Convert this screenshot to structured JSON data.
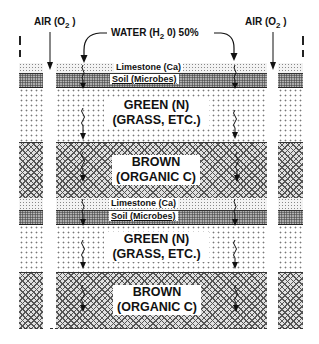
{
  "diagram": {
    "top_labels": {
      "air_left": {
        "text": "AIR (O",
        "sub": "2",
        "close": " )"
      },
      "water": {
        "text": "WATER (H",
        "sub": "2",
        "rest": " 0) 50%"
      },
      "air_right": {
        "text": "AIR (O",
        "sub": "2",
        "close": " )"
      }
    },
    "layers": [
      {
        "id": "limestone-1",
        "type": "limestone",
        "label": "Limestone  (Ca)"
      },
      {
        "id": "soil-1",
        "type": "soil",
        "label": "Soil  (Microbes)"
      },
      {
        "id": "green-1",
        "type": "green",
        "line1": "GREEN (N)",
        "line2": "(GRASS, ETC.)"
      },
      {
        "id": "brown-1",
        "type": "brown",
        "line1": "BROWN",
        "line2": "(ORGANIC C)"
      },
      {
        "id": "limestone-2",
        "type": "limestone",
        "label": "Limestone  (Ca)"
      },
      {
        "id": "soil-2",
        "type": "soil",
        "label": "Soil  (Microbes)"
      },
      {
        "id": "green-2",
        "type": "green",
        "line1": "GREEN (N)",
        "line2": "(GRASS, ETC.)"
      },
      {
        "id": "brown-2",
        "type": "brown",
        "line1": "BROWN",
        "line2": "(ORGANIC C)"
      }
    ],
    "icons": {
      "air_arrow": "down-arrow-icon",
      "water_arrow": "curved-down-arrow-icon",
      "percolation": "wavy-down-arrow-icon"
    }
  }
}
